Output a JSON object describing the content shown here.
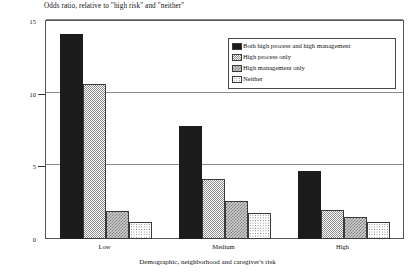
{
  "chart_data": {
    "type": "bar",
    "title": "Odds ratio, relative to \"high risk\" and \"neither\"",
    "xlabel": "Demographic, neighborhood and caregiver's risk",
    "ylabel": "",
    "categories": [
      "Low",
      "Medium",
      "High"
    ],
    "ylim": [
      0,
      15
    ],
    "yticks": [
      0,
      5,
      10,
      15
    ],
    "ytick_labels": [
      "0",
      "5",
      "10",
      "15"
    ],
    "grid": true,
    "legend_position": "top-right",
    "series": [
      {
        "name": "Both high process and high management",
        "pattern": "solid-black",
        "values": [
          14.1,
          7.8,
          4.7
        ]
      },
      {
        "name": "High process only",
        "pattern": "fine-check",
        "values": [
          10.7,
          4.1,
          2.0
        ]
      },
      {
        "name": "High management only",
        "pattern": "medium-check",
        "values": [
          1.9,
          2.6,
          1.5
        ]
      },
      {
        "name": "Neither",
        "pattern": "dots",
        "values": [
          1.2,
          1.8,
          1.2
        ]
      }
    ]
  },
  "colors": {
    "series_1": "#1c1c1c",
    "series_2": "#8e8e8e",
    "series_3": "#7b7b7b",
    "series_4": "#6f6f6f",
    "frame": "#555555",
    "gridline": "#8a8a8a"
  }
}
